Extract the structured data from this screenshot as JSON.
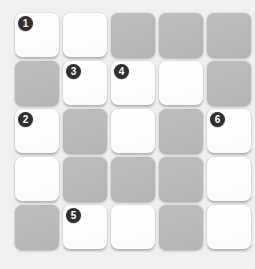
{
  "board": {
    "rows": 5,
    "columns": 5,
    "colors": {
      "background": "#f1f0ee",
      "cell_white": "#fdfdfd",
      "cell_gray": "#b9b9b9",
      "marker_fill": "#2f2f2f",
      "marker_text": "#ffffff"
    },
    "cells": [
      {
        "row": 1,
        "col": 1,
        "state": "white",
        "marker": "1"
      },
      {
        "row": 1,
        "col": 2,
        "state": "white",
        "marker": ""
      },
      {
        "row": 1,
        "col": 3,
        "state": "gray",
        "marker": ""
      },
      {
        "row": 1,
        "col": 4,
        "state": "gray",
        "marker": ""
      },
      {
        "row": 1,
        "col": 5,
        "state": "gray",
        "marker": ""
      },
      {
        "row": 2,
        "col": 1,
        "state": "gray",
        "marker": ""
      },
      {
        "row": 2,
        "col": 2,
        "state": "white",
        "marker": "3"
      },
      {
        "row": 2,
        "col": 3,
        "state": "white",
        "marker": "4"
      },
      {
        "row": 2,
        "col": 4,
        "state": "white",
        "marker": ""
      },
      {
        "row": 2,
        "col": 5,
        "state": "gray",
        "marker": ""
      },
      {
        "row": 3,
        "col": 1,
        "state": "white",
        "marker": "2"
      },
      {
        "row": 3,
        "col": 2,
        "state": "gray",
        "marker": ""
      },
      {
        "row": 3,
        "col": 3,
        "state": "white",
        "marker": ""
      },
      {
        "row": 3,
        "col": 4,
        "state": "gray",
        "marker": ""
      },
      {
        "row": 3,
        "col": 5,
        "state": "white",
        "marker": "6"
      },
      {
        "row": 4,
        "col": 1,
        "state": "white",
        "marker": ""
      },
      {
        "row": 4,
        "col": 2,
        "state": "gray",
        "marker": ""
      },
      {
        "row": 4,
        "col": 3,
        "state": "gray",
        "marker": ""
      },
      {
        "row": 4,
        "col": 4,
        "state": "gray",
        "marker": ""
      },
      {
        "row": 4,
        "col": 5,
        "state": "white",
        "marker": ""
      },
      {
        "row": 5,
        "col": 1,
        "state": "gray",
        "marker": ""
      },
      {
        "row": 5,
        "col": 2,
        "state": "white",
        "marker": "5"
      },
      {
        "row": 5,
        "col": 3,
        "state": "white",
        "marker": ""
      },
      {
        "row": 5,
        "col": 4,
        "state": "gray",
        "marker": ""
      },
      {
        "row": 5,
        "col": 5,
        "state": "white",
        "marker": ""
      }
    ]
  }
}
